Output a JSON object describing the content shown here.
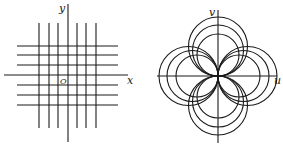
{
  "figure": {
    "left_panel": {
      "description": "Rectangular grid in the z-plane",
      "labels": {
        "x_axis": "x",
        "y_axis": "y",
        "origin": "O"
      },
      "vertical_lines_x": [
        39,
        49,
        58,
        77,
        86,
        96
      ],
      "horizontal_lines_y": [
        46,
        55,
        65,
        85,
        95,
        105
      ],
      "grid_extent": {
        "x_min": 17,
        "x_max": 118,
        "y_min": 23,
        "y_max": 128
      },
      "axes": {
        "origin": [
          68,
          75
        ],
        "x_axis_range": [
          4,
          128
        ],
        "y_axis_range": [
          4,
          142
        ]
      }
    },
    "right_panel": {
      "description": "Image of grid under mapping: families of circles through the origin",
      "labels": {
        "u_axis": "u",
        "v_axis": "v"
      },
      "origin": [
        218,
        76
      ],
      "circle_radii": [
        21,
        25.5,
        29.5
      ],
      "petal_directions": [
        "up",
        "down",
        "left",
        "right"
      ],
      "axes": {
        "u_axis_range": [
          157,
          277
        ],
        "v_axis_range": [
          10,
          143
        ]
      }
    },
    "colors": {
      "line": "#1a1a1a",
      "background": "#ffffff"
    }
  }
}
